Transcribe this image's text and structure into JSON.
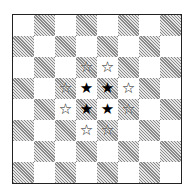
{
  "board": {
    "rows": 8,
    "cols": 8,
    "top_left_color": "light",
    "colors": {
      "light": "#ffffff",
      "dark_hatch": "#8a8a8a",
      "border": "#222222"
    },
    "pieces": [
      {
        "row": 2,
        "col": 3,
        "type": "hollow-star",
        "glyph": "☆"
      },
      {
        "row": 2,
        "col": 4,
        "type": "hollow-star",
        "glyph": "☆"
      },
      {
        "row": 3,
        "col": 2,
        "type": "hollow-star",
        "glyph": "☆"
      },
      {
        "row": 3,
        "col": 3,
        "type": "filled-star",
        "glyph": "★"
      },
      {
        "row": 3,
        "col": 4,
        "type": "filled-star",
        "glyph": "★"
      },
      {
        "row": 3,
        "col": 5,
        "type": "hollow-star",
        "glyph": "☆"
      },
      {
        "row": 4,
        "col": 2,
        "type": "hollow-star",
        "glyph": "☆"
      },
      {
        "row": 4,
        "col": 3,
        "type": "filled-star",
        "glyph": "★"
      },
      {
        "row": 4,
        "col": 4,
        "type": "filled-star",
        "glyph": "★"
      },
      {
        "row": 4,
        "col": 5,
        "type": "hollow-star",
        "glyph": "☆"
      },
      {
        "row": 5,
        "col": 3,
        "type": "hollow-star",
        "glyph": "☆"
      },
      {
        "row": 5,
        "col": 4,
        "type": "hollow-star",
        "glyph": "☆"
      }
    ]
  }
}
